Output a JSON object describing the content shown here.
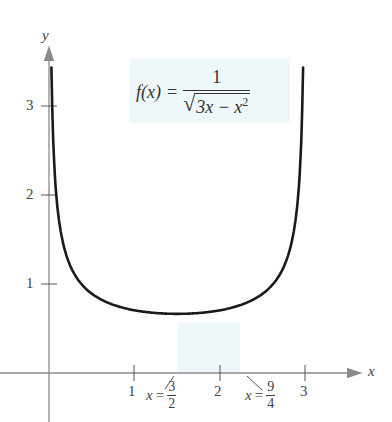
{
  "chart_data": {
    "type": "line",
    "function": {
      "name": "f(x)",
      "lhs": "f(x)",
      "equals": "=",
      "numerator": "1",
      "radicand_prefix": "3x − x",
      "radicand_exponent": "2"
    },
    "xlabel": "x",
    "ylabel": "y",
    "xlim": [
      0,
      3.5
    ],
    "ylim": [
      0,
      4
    ],
    "x_ticks": [
      {
        "value": 1,
        "label": "1"
      },
      {
        "value": 2,
        "label": "2"
      },
      {
        "value": 3,
        "label": "3"
      }
    ],
    "y_ticks": [
      {
        "value": 1,
        "label": "1"
      },
      {
        "value": 2,
        "label": "2"
      },
      {
        "value": 3,
        "label": "3"
      }
    ],
    "annotations": [
      {
        "text": "x = 3/2",
        "var": "x",
        "eq": "=",
        "num": "3",
        "den": "2",
        "x": 1.5
      },
      {
        "text": "x = 9/4",
        "var": "x",
        "eq": "=",
        "num": "9",
        "den": "4",
        "x": 2.25
      }
    ],
    "series": [
      {
        "name": "f(x)",
        "x": [
          0.02,
          0.05,
          0.1,
          0.2,
          0.3,
          0.5,
          0.75,
          1.0,
          1.25,
          1.5,
          1.75,
          2.0,
          2.25,
          2.5,
          2.7,
          2.8,
          2.9,
          2.95,
          2.98
        ],
        "values": [
          4.1,
          2.6,
          1.86,
          1.34,
          1.11,
          0.89,
          0.77,
          0.71,
          0.68,
          0.667,
          0.68,
          0.71,
          0.77,
          0.89,
          1.11,
          1.34,
          1.86,
          2.6,
          4.1
        ]
      }
    ],
    "minimum": {
      "x": 1.5,
      "y": 0.667
    },
    "asymptotes": [
      0,
      3
    ],
    "grid": false,
    "legend": "none"
  },
  "labels": {
    "x_axis": "x",
    "y_axis": "y",
    "tick_x_1": "1",
    "tick_x_2": "2",
    "tick_x_3": "3",
    "tick_y_1": "1",
    "tick_y_2": "2",
    "tick_y_3": "3"
  },
  "colors": {
    "curve": "#1a1a1a",
    "axis": "#8a8a8a",
    "tint": "#eef8fb"
  }
}
